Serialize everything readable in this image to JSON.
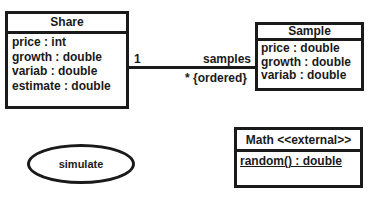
{
  "classes": {
    "share": {
      "name": "Share",
      "attributes": [
        "price : int",
        "growth : double",
        "variab : double",
        "estimate : double"
      ]
    },
    "sample": {
      "name": "Sample",
      "attributes": [
        "price : double",
        "growth : double",
        "variab : double"
      ]
    },
    "math": {
      "name": "Math <<external>>",
      "operations": [
        "random() : double"
      ]
    }
  },
  "association": {
    "source_multiplicity": "1",
    "target_role": "samples",
    "target_multiplicity": "* {ordered}"
  },
  "use_case": {
    "label": "simulate"
  },
  "colors": {
    "stroke": "#1a1a1a",
    "background": "#ffffff"
  }
}
